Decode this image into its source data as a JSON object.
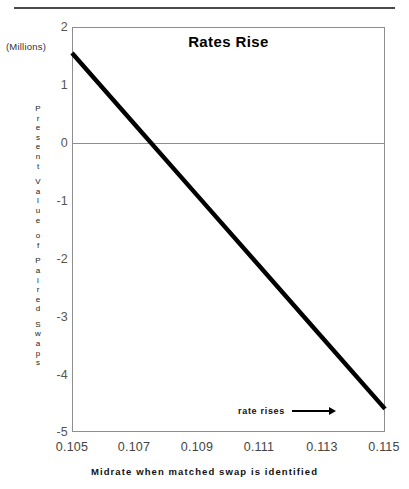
{
  "page": {
    "top_rule": "horizontal-rule"
  },
  "chart_data": {
    "type": "line",
    "title": "Rates Rise",
    "xlabel": "Midrate when matched swap is identified",
    "ylabel": "Present Value of Paired Swaps",
    "unit_note": "(Millions)",
    "xlim": [
      0.105,
      0.115
    ],
    "ylim": [
      -5,
      2
    ],
    "xticks": [
      0.105,
      0.107,
      0.109,
      0.111,
      0.113,
      0.115
    ],
    "xtick_labels": [
      "0.105",
      "0.107",
      "0.109",
      "0.111",
      "0.113",
      "0.115"
    ],
    "yticks": [
      2,
      1,
      0,
      -1,
      -2,
      -3,
      -4,
      -5
    ],
    "ytick_labels": [
      "2",
      "1",
      "0",
      "-1",
      "-2",
      "-3",
      "-4",
      "-5"
    ],
    "grid": false,
    "legend": "none",
    "zero_line": true,
    "series": [
      {
        "name": "Present value of paired swaps",
        "x": [
          0.105,
          0.107,
          0.109,
          0.111,
          0.113,
          0.115
        ],
        "values": [
          1.55,
          0.32,
          -0.91,
          -2.14,
          -3.37,
          -4.6
        ]
      }
    ],
    "annotations": [
      {
        "text": "rate rises",
        "icon": "right-arrow-icon",
        "x": 0.1115,
        "y": -4.4
      }
    ]
  }
}
